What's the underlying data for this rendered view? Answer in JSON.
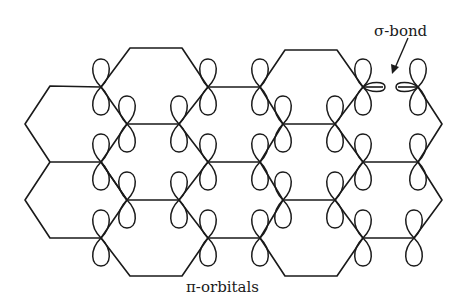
{
  "diagram": {
    "labels": {
      "sigma_bond": "σ-bond",
      "pi_orbitals": "π-orbitals"
    },
    "colors": {
      "line": "#1a1a1a",
      "background": "#ffffff"
    },
    "lattice": {
      "type": "hexagonal",
      "hexagon_count": 7,
      "pi_orbital_sites": 24
    }
  }
}
